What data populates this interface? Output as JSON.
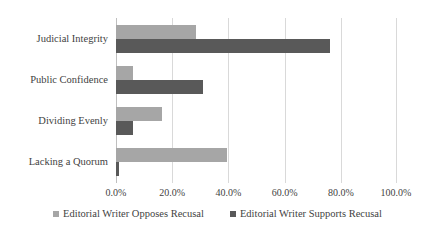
{
  "chart_data": {
    "type": "bar",
    "orientation": "horizontal",
    "title": "",
    "xlabel": "",
    "ylabel": "",
    "categories": [
      "Judicial Integrity",
      "Public Confidence",
      "Dividing Evenly",
      "Lacking a Quorum"
    ],
    "series": [
      {
        "name": "Editorial Writer Opposes Recusal",
        "color": "#a6a6a6",
        "values": [
          28.5,
          6.2,
          16.4,
          39.5
        ]
      },
      {
        "name": "Editorial Writer Supports Recusal",
        "color": "#595959",
        "values": [
          76.0,
          31.0,
          6.2,
          1.2
        ]
      }
    ],
    "xlim": [
      0,
      100
    ],
    "xticks": [
      0,
      20,
      40,
      60,
      80,
      100
    ],
    "xtick_labels": [
      "0.0%",
      "20.0%",
      "40.0%",
      "60.0%",
      "80.0%",
      "100.0%"
    ],
    "grid": true,
    "legend_position": "bottom"
  },
  "legend": {
    "items": [
      {
        "label": "Editorial Writer Opposes Recusal"
      },
      {
        "label": "Editorial Writer Supports Recusal"
      }
    ]
  }
}
